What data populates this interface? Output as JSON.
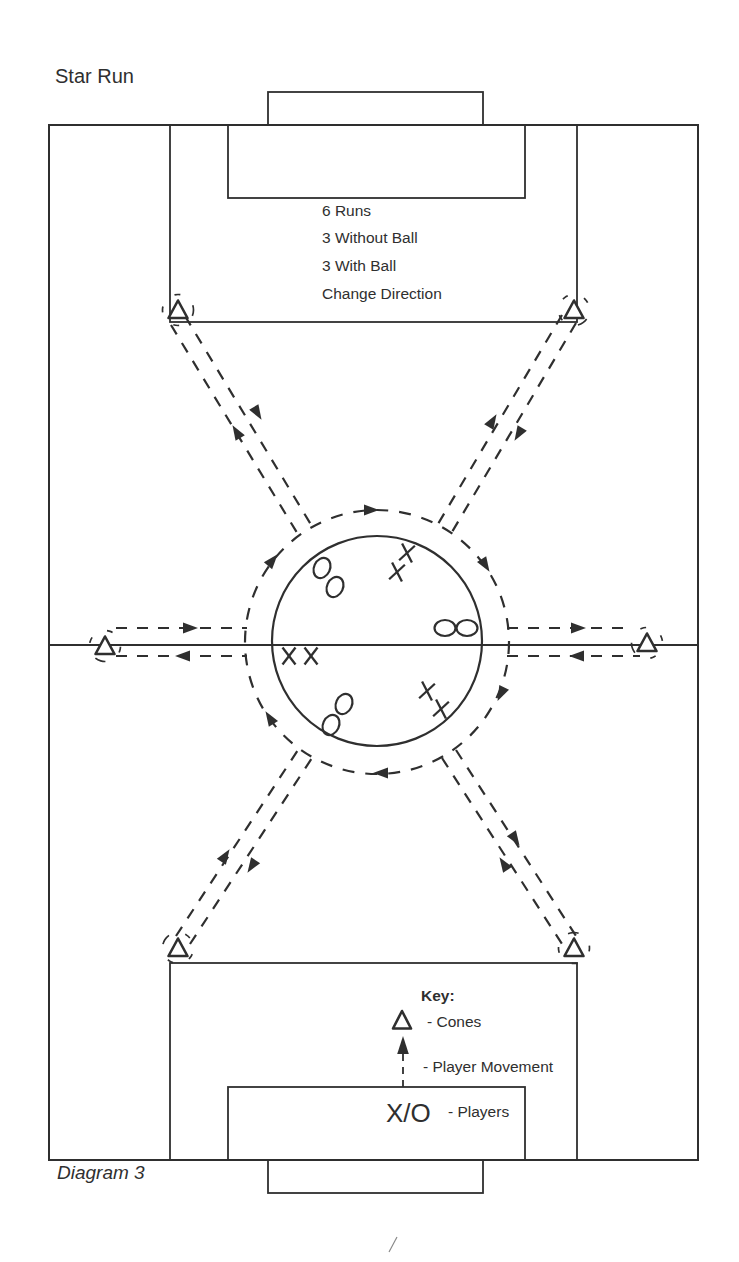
{
  "title": "Star Run",
  "caption": "Diagram 3",
  "instructions": [
    "6 Runs",
    "3 Without Ball",
    "3 With Ball",
    "Change Direction"
  ],
  "key": {
    "heading": "Key:",
    "cone_label": "- Cones",
    "movement_label": "- Player Movement",
    "players_symbol": "X/O",
    "players_label": "- Players"
  },
  "colors": {
    "ink": "#2f2f2f",
    "paper": "#ffffff"
  },
  "diagram": {
    "pitch": {
      "outline": [
        49,
        125,
        649,
        1035
      ],
      "halfway_line": [
        49,
        645,
        698,
        645
      ],
      "center_circle": [
        377,
        641,
        105
      ],
      "boxes": [
        {
          "name": "top-goal",
          "r": [
            268,
            92,
            215,
            33
          ]
        },
        {
          "name": "top-six-yard-box",
          "r": [
            228,
            125,
            297,
            73
          ]
        },
        {
          "name": "top-penalty-box",
          "r": [
            170,
            125,
            407,
            197
          ]
        },
        {
          "name": "bottom-penalty-box",
          "r": [
            170,
            963,
            407,
            197
          ]
        },
        {
          "name": "bottom-six-yard-box",
          "r": [
            228,
            1087,
            297,
            73
          ]
        },
        {
          "name": "bottom-goal",
          "r": [
            268,
            1160,
            215,
            33
          ]
        }
      ]
    },
    "dashed_ring": [
      377,
      642,
      132
    ],
    "ring_arrows": [
      [
        378,
        510,
        0
      ],
      [
        489,
        571,
        58
      ],
      [
        498,
        700,
        116
      ],
      [
        374,
        773,
        180
      ],
      [
        266,
        712,
        -122
      ],
      [
        277,
        555,
        -50
      ]
    ],
    "run_lines": [
      [
        116,
        628,
        247,
        628,
        197,
        628,
        0
      ],
      [
        116,
        656,
        247,
        656,
        176,
        656,
        180
      ],
      [
        507,
        628,
        632,
        628,
        585,
        628,
        0
      ],
      [
        507,
        656,
        640,
        656,
        570,
        656,
        180
      ],
      [
        171,
        325,
        299,
        536,
        233,
        426,
        -121
      ],
      [
        185,
        316,
        313,
        528,
        261,
        419,
        59
      ],
      [
        562,
        315,
        438,
        524,
        496,
        415,
        -59
      ],
      [
        576,
        323,
        452,
        532,
        515,
        440,
        121
      ],
      [
        176,
        936,
        298,
        750,
        229,
        850,
        -57
      ],
      [
        190,
        944,
        312,
        758,
        248,
        872,
        123
      ],
      [
        442,
        758,
        562,
        944,
        500,
        858,
        -123
      ],
      [
        456,
        750,
        576,
        936,
        519,
        845,
        57
      ]
    ],
    "cones": [
      [
        178,
        310
      ],
      [
        574,
        310
      ],
      [
        105,
        646
      ],
      [
        647,
        643
      ],
      [
        178,
        948
      ],
      [
        574,
        948
      ]
    ],
    "players": [
      {
        "t": "O",
        "x": 322,
        "y": 568,
        "r": 25
      },
      {
        "t": "O",
        "x": 335,
        "y": 587,
        "r": 25
      },
      {
        "t": "X",
        "x": 407,
        "y": 553,
        "r": 10
      },
      {
        "t": "X",
        "x": 397,
        "y": 572,
        "r": 10
      },
      {
        "t": "O",
        "x": 445,
        "y": 628,
        "r": 90
      },
      {
        "t": "O",
        "x": 467,
        "y": 628,
        "r": 90
      },
      {
        "t": "X",
        "x": 289,
        "y": 656,
        "r": 0
      },
      {
        "t": "X",
        "x": 311,
        "y": 656,
        "r": 0
      },
      {
        "t": "O",
        "x": 344,
        "y": 704,
        "r": 25
      },
      {
        "t": "O",
        "x": 331,
        "y": 725,
        "r": 25
      },
      {
        "t": "X",
        "x": 427,
        "y": 691,
        "r": 10
      },
      {
        "t": "X",
        "x": 441,
        "y": 709,
        "r": 10
      }
    ]
  }
}
